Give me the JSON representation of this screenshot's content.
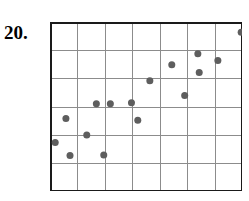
{
  "label": {
    "text": "20."
  },
  "chart_data": {
    "type": "scatter",
    "title": "",
    "xlabel": "",
    "ylabel": "",
    "grid": true,
    "legend": null,
    "xlim": [
      0,
      7
    ],
    "ylim": [
      0,
      6
    ],
    "xticks": [
      0,
      1,
      2,
      3,
      4,
      5,
      6,
      7
    ],
    "yticks": [
      0,
      1,
      2,
      3,
      4,
      5,
      6
    ],
    "xticklabels": [],
    "yticklabels": [],
    "grid_columns": 7,
    "grid_rows": 6,
    "marker": {
      "shape": "circle",
      "color": "#5e5e5e",
      "size_px": 7
    },
    "border_color": "#1a1a1a",
    "grid_color": "#8c8c8c",
    "points": [
      {
        "x": 0.19,
        "y": 1.72
      },
      {
        "x": 0.58,
        "y": 2.57
      },
      {
        "x": 0.73,
        "y": 1.26
      },
      {
        "x": 1.34,
        "y": 1.99
      },
      {
        "x": 1.69,
        "y": 3.1
      },
      {
        "x": 1.96,
        "y": 1.28
      },
      {
        "x": 2.2,
        "y": 3.1
      },
      {
        "x": 2.97,
        "y": 3.13
      },
      {
        "x": 3.2,
        "y": 2.51
      },
      {
        "x": 3.64,
        "y": 3.91
      },
      {
        "x": 4.44,
        "y": 4.48
      },
      {
        "x": 4.91,
        "y": 3.39
      },
      {
        "x": 5.39,
        "y": 4.87
      },
      {
        "x": 5.44,
        "y": 4.21
      },
      {
        "x": 6.12,
        "y": 4.63
      },
      {
        "x": 6.97,
        "y": 5.64
      }
    ]
  }
}
